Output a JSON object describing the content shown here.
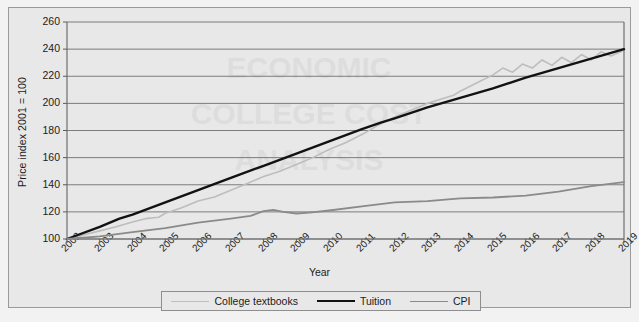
{
  "chart_data": {
    "type": "line",
    "title": "",
    "xlabel": "Year",
    "ylabel": "Price index 2001 = 100",
    "xlim": [
      2002,
      2019
    ],
    "ylim": [
      100,
      260
    ],
    "ytick_step": 20,
    "grid": true,
    "legend_position": "bottom",
    "yticks": [
      260,
      240,
      220,
      200,
      180,
      160,
      140,
      120,
      100
    ],
    "x": [
      2002,
      2003,
      2004,
      2005,
      2006,
      2007,
      2008,
      2009,
      2010,
      2011,
      2012,
      2013,
      2014,
      2015,
      2016,
      2017,
      2018,
      2019
    ],
    "series": [
      {
        "name": "College textbooks",
        "color": "#bdbdbd",
        "width": 1.6,
        "values": [
          100,
          106,
          112,
          120,
          128,
          136,
          146,
          155,
          166,
          177,
          190,
          200,
          209,
          221,
          231,
          238,
          236,
          240
        ]
      },
      {
        "name": "Tuition",
        "color": "#121212",
        "width": 2.4,
        "values": [
          100,
          109,
          118,
          127,
          136,
          145,
          154,
          163,
          172,
          181,
          189,
          197,
          204,
          211,
          219,
          226,
          233,
          240
        ]
      },
      {
        "name": "CPI",
        "color": "#8a8a8a",
        "width": 1.8,
        "values": [
          100,
          102,
          105,
          108,
          112,
          115,
          119,
          119,
          121,
          124,
          127,
          128,
          130,
          131,
          132,
          135,
          139,
          142
        ]
      }
    ],
    "detail_paths": {
      "college_textbooks": [
        [
          2002,
          100
        ],
        [
          2002.5,
          103
        ],
        [
          2003,
          106
        ],
        [
          2003.5,
          109
        ],
        [
          2004,
          112.5
        ],
        [
          2004.4,
          115
        ],
        [
          2004.8,
          116
        ],
        [
          2005,
          119
        ],
        [
          2005.5,
          123
        ],
        [
          2006,
          128
        ],
        [
          2006.5,
          131
        ],
        [
          2007,
          136
        ],
        [
          2007.5,
          141
        ],
        [
          2008,
          146
        ],
        [
          2008.5,
          150
        ],
        [
          2009,
          155
        ],
        [
          2009.5,
          160
        ],
        [
          2010,
          166
        ],
        [
          2010.5,
          171
        ],
        [
          2011,
          177
        ],
        [
          2011.5,
          184
        ],
        [
          2012,
          190
        ],
        [
          2012.5,
          195
        ],
        [
          2013,
          200
        ],
        [
          2013.4,
          203
        ],
        [
          2013.8,
          206
        ],
        [
          2014,
          209
        ],
        [
          2014.5,
          215
        ],
        [
          2015,
          221
        ],
        [
          2015.3,
          226
        ],
        [
          2015.6,
          223
        ],
        [
          2015.9,
          229
        ],
        [
          2016.2,
          226
        ],
        [
          2016.5,
          232
        ],
        [
          2016.8,
          228
        ],
        [
          2017.1,
          234
        ],
        [
          2017.4,
          230
        ],
        [
          2017.7,
          236
        ],
        [
          2018,
          232
        ],
        [
          2018.3,
          238
        ],
        [
          2018.6,
          235
        ],
        [
          2018.9,
          238
        ],
        [
          2019,
          240
        ]
      ],
      "tuition": [
        [
          2002,
          100
        ],
        [
          2003,
          109
        ],
        [
          2003.6,
          115
        ],
        [
          2004,
          118
        ],
        [
          2005,
          127
        ],
        [
          2006,
          136
        ],
        [
          2007,
          145
        ],
        [
          2008,
          154
        ],
        [
          2009,
          163
        ],
        [
          2010,
          172
        ],
        [
          2011,
          181
        ],
        [
          2011.6,
          186
        ],
        [
          2012,
          189
        ],
        [
          2013,
          197
        ],
        [
          2014,
          204
        ],
        [
          2015,
          211
        ],
        [
          2016,
          219
        ],
        [
          2017,
          226
        ],
        [
          2018,
          233
        ],
        [
          2019,
          240
        ]
      ],
      "cpi": [
        [
          2002,
          100
        ],
        [
          2003,
          102
        ],
        [
          2004,
          105
        ],
        [
          2005,
          108
        ],
        [
          2006,
          112
        ],
        [
          2007,
          115
        ],
        [
          2007.6,
          117
        ],
        [
          2008,
          120.5
        ],
        [
          2008.3,
          121.5
        ],
        [
          2008.6,
          120
        ],
        [
          2009,
          118.8
        ],
        [
          2009.4,
          119.5
        ],
        [
          2010,
          121
        ],
        [
          2011,
          124
        ],
        [
          2012,
          127
        ],
        [
          2012.6,
          127.5
        ],
        [
          2013,
          128
        ],
        [
          2014,
          130
        ],
        [
          2015,
          130.6
        ],
        [
          2016,
          132
        ],
        [
          2017,
          135
        ],
        [
          2018,
          139
        ],
        [
          2019,
          142
        ]
      ]
    }
  },
  "legend": {
    "items": [
      {
        "label": "College textbooks",
        "color": "#bdbdbd"
      },
      {
        "label": "Tuition",
        "color": "#121212"
      },
      {
        "label": "CPI",
        "color": "#8a8a8a"
      }
    ]
  },
  "axes": {
    "y_title": "Price index 2001 = 100",
    "x_title": "Year"
  }
}
